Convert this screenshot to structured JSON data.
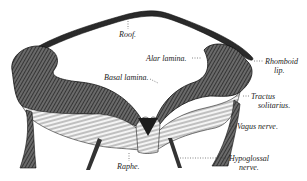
{
  "figure": {
    "labels": {
      "roof": "Roof.",
      "alar_lamina": "Alar lamina.",
      "basal_lamina": "Basal lamina.",
      "rhomboid_lip_1": "Rhomboid",
      "rhomboid_lip_2": "lip.",
      "tractus_1": "Tractus",
      "tractus_2": "solitarius.",
      "vagus": "Vagus nerve.",
      "raphe": "Raphe.",
      "hypoglossal_1": "Hypoglossal",
      "hypoglossal_2": "nerve."
    },
    "colors": {
      "ink": "#222222",
      "tissue": "#3a3a3a",
      "background": "#ffffff"
    }
  }
}
